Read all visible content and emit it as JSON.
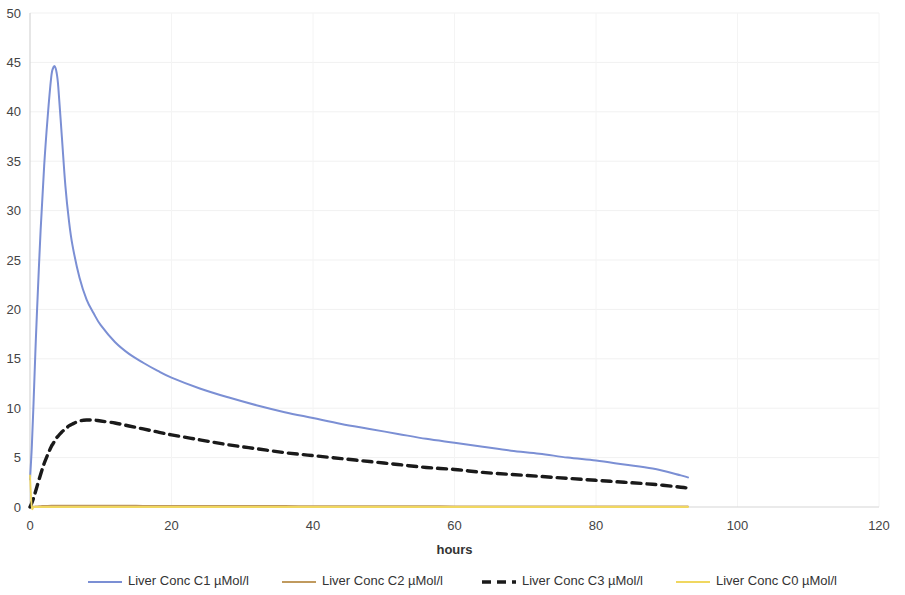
{
  "chart_data": {
    "type": "line",
    "title": "",
    "xlabel": "hours",
    "ylabel": "",
    "xlim": [
      0,
      120
    ],
    "ylim": [
      0,
      50
    ],
    "grid": true,
    "legend_position": "bottom",
    "x_ticks": [
      "0",
      "20",
      "40",
      "60",
      "80",
      "100",
      "120"
    ],
    "y_ticks": [
      "0",
      "5",
      "10",
      "15",
      "20",
      "25",
      "30",
      "35",
      "40",
      "45",
      "50"
    ],
    "x": [
      0,
      0.25,
      0.5,
      0.75,
      1,
      1.5,
      2,
      2.5,
      3,
      3.25,
      3.5,
      3.75,
      4,
      4.5,
      5,
      5.5,
      6,
      7,
      8,
      9,
      10,
      12,
      14,
      16,
      18,
      20,
      24,
      28,
      32,
      36,
      40,
      44,
      48,
      52,
      56,
      60,
      64,
      68,
      72,
      76,
      80,
      84,
      88,
      92,
      93
    ],
    "series": [
      {
        "name": "Liver Conc C1 µMol/l",
        "color": "#7B8FD4",
        "style": "solid",
        "width": 2.0,
        "values": [
          2.8,
          6.0,
          10.5,
          15.5,
          20.0,
          28.0,
          34.5,
          39.5,
          43.5,
          44.4,
          44.6,
          44.0,
          42.5,
          37.5,
          32.5,
          29.0,
          26.5,
          23.2,
          21.0,
          19.6,
          18.4,
          16.7,
          15.5,
          14.6,
          13.8,
          13.1,
          12.0,
          11.1,
          10.3,
          9.6,
          9.0,
          8.4,
          7.9,
          7.4,
          6.9,
          6.5,
          6.1,
          5.7,
          5.4,
          5.0,
          4.7,
          4.3,
          3.9,
          3.2,
          3.0
        ]
      },
      {
        "name": "Liver Conc C2 µMol/l",
        "color": "#C09A5E",
        "style": "solid",
        "width": 1.6,
        "values": [
          0.0,
          0.02,
          0.04,
          0.06,
          0.08,
          0.1,
          0.12,
          0.13,
          0.14,
          0.14,
          0.15,
          0.15,
          0.15,
          0.15,
          0.15,
          0.15,
          0.15,
          0.15,
          0.15,
          0.15,
          0.14,
          0.14,
          0.14,
          0.13,
          0.13,
          0.13,
          0.12,
          0.12,
          0.11,
          0.11,
          0.1,
          0.1,
          0.09,
          0.09,
          0.09,
          0.08,
          0.08,
          0.08,
          0.07,
          0.07,
          0.07,
          0.06,
          0.06,
          0.06,
          0.06
        ]
      },
      {
        "name": "Liver Conc C3 µMol/l",
        "color": "#1A1A1A",
        "style": "dashed",
        "width": 3.4,
        "values": [
          0.0,
          0.4,
          0.9,
          1.5,
          2.1,
          3.3,
          4.4,
          5.3,
          6.1,
          6.4,
          6.7,
          7.0,
          7.2,
          7.6,
          7.9,
          8.2,
          8.4,
          8.7,
          8.8,
          8.8,
          8.7,
          8.5,
          8.2,
          7.9,
          7.6,
          7.3,
          6.8,
          6.3,
          5.9,
          5.5,
          5.2,
          4.9,
          4.6,
          4.3,
          4.0,
          3.8,
          3.5,
          3.3,
          3.1,
          2.9,
          2.7,
          2.5,
          2.3,
          2.0,
          1.9
        ]
      },
      {
        "name": "Liver Conc C0 µMol/l",
        "color": "#F0D760",
        "style": "solid",
        "width": 1.8,
        "values": [
          3.2,
          0.0,
          0.0,
          0.0,
          0.0,
          0.0,
          0.0,
          0.0,
          0.0,
          0.0,
          0.0,
          0.0,
          0.0,
          0.0,
          0.0,
          0.0,
          0.0,
          0.0,
          0.0,
          0.0,
          0.0,
          0.0,
          0.0,
          0.0,
          0.0,
          0.0,
          0.0,
          0.0,
          0.0,
          0.0,
          0.0,
          0.0,
          0.0,
          0.0,
          0.0,
          0.0,
          0.0,
          0.0,
          0.0,
          0.0,
          0.0,
          0.0,
          0.0,
          0.0,
          0.0
        ]
      }
    ]
  },
  "legend": {
    "items": [
      {
        "label": "Liver Conc C1 µMol/l",
        "color": "#7B8FD4",
        "style": "solid"
      },
      {
        "label": "Liver Conc C2 µMol/l",
        "color": "#C09A5E",
        "style": "solid"
      },
      {
        "label": "Liver Conc C3 µMol/l",
        "color": "#1A1A1A",
        "style": "dashed"
      },
      {
        "label": "Liver Conc C0 µMol/l",
        "color": "#F0D760",
        "style": "solid"
      }
    ]
  },
  "axes": {
    "x_title": "hours",
    "y_title": ""
  }
}
